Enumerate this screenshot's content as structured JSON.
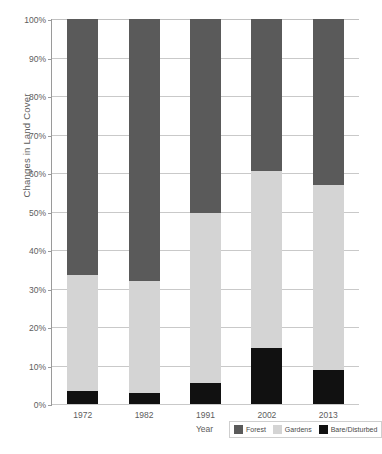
{
  "chart_data": {
    "type": "bar",
    "subtype": "stacked-100-percent",
    "title": "",
    "xlabel": "Year",
    "ylabel": "Changes in Land Cover",
    "categories": [
      "1972",
      "1982",
      "1991",
      "2002",
      "2013"
    ],
    "ylim": [
      0,
      100
    ],
    "ytick_labels": [
      "0%",
      "10%",
      "20%",
      "30%",
      "40%",
      "50%",
      "60%",
      "70%",
      "80%",
      "90%",
      "100%"
    ],
    "ytick_values": [
      0,
      10,
      20,
      30,
      40,
      50,
      60,
      70,
      80,
      90,
      100
    ],
    "grid": true,
    "legend_position": "bottom-right",
    "series": [
      {
        "name": "Bare/Disturbed",
        "color": "#111111",
        "values": [
          3.4,
          2.8,
          5.5,
          14.5,
          8.8
        ]
      },
      {
        "name": "Gardens",
        "color": "#d4d4d4",
        "values": [
          30.1,
          29.2,
          44.0,
          46.0,
          48.2
        ]
      },
      {
        "name": "Forest",
        "color": "#5a5a5a",
        "values": [
          66.5,
          68.0,
          50.5,
          39.5,
          43.0
        ]
      }
    ],
    "cumulative_tops": {
      "bare_disturbed": [
        3.4,
        2.8,
        5.5,
        14.5,
        8.8
      ],
      "gardens": [
        33.5,
        32.0,
        49.5,
        60.5,
        57.0
      ],
      "forest": [
        100,
        100,
        100,
        100,
        100
      ]
    }
  },
  "legend": {
    "items": [
      {
        "label": "Forest",
        "color": "#5a5a5a"
      },
      {
        "label": "Gardens",
        "color": "#d4d4d4"
      },
      {
        "label": "Bare/Disturbed",
        "color": "#111111"
      }
    ]
  },
  "caption": ""
}
